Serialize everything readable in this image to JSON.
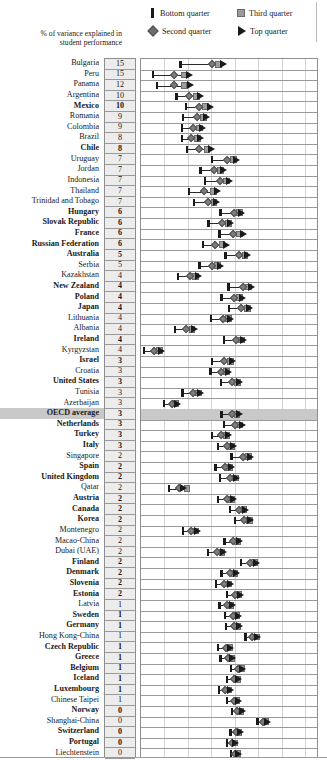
{
  "legend": {
    "items": [
      {
        "label": "Bottom quarter",
        "marker": "bar-icon"
      },
      {
        "label": "Third quarter",
        "marker": "square-icon"
      },
      {
        "label": "Second quarter",
        "marker": "diamond-icon"
      },
      {
        "label": "Top quarter",
        "marker": "triangle-icon"
      }
    ]
  },
  "axis_caption": "% of variance explained in student performance",
  "chart_data": {
    "type": "scatter",
    "title": "",
    "subtitle": "",
    "xlabel": "",
    "ylabel": "",
    "legend_position": "top",
    "grid": true,
    "xlim": [
      300,
      680
    ],
    "x_gridlines": [
      350,
      400,
      450,
      500,
      550,
      600,
      650
    ],
    "value_column_header": "% of variance explained in student performance",
    "series": [
      {
        "name": "Bottom quarter",
        "marker": "bar",
        "color": "#1a1a1a"
      },
      {
        "name": "Second quarter",
        "marker": "diamond",
        "color": "#7d7d7d"
      },
      {
        "name": "Third quarter",
        "marker": "square",
        "color": "#9d9d9d"
      },
      {
        "name": "Top quarter",
        "marker": "triangle",
        "color": "#1a1a1a"
      }
    ],
    "categories": [
      "Bulgaria",
      "Peru",
      "Panama",
      "Argentina",
      "Mexico",
      "Romania",
      "Colombia",
      "Brazil",
      "Chile",
      "Uruguay",
      "Jordan",
      "Indonesia",
      "Thailand",
      "Trinidad and Tobago",
      "Hungary",
      "Slovak Republic",
      "France",
      "Russian Federation",
      "Australia",
      "Serbia",
      "Kazakhstan",
      "New Zealand",
      "Poland",
      "Japan",
      "Lithuania",
      "Albania",
      "Ireland",
      "Kyrgyzstan",
      "Israel",
      "Croatia",
      "United States",
      "Tunisia",
      "Azerbaijan",
      "OECD average",
      "Netherlands",
      "Turkey",
      "Italy",
      "Singapore",
      "Spain",
      "United Kingdom",
      "Qatar",
      "Austria",
      "Canada",
      "Korea",
      "Montenegro",
      "Macao-China",
      "Dubai (UAE)",
      "Finland",
      "Denmark",
      "Slovenia",
      "Estonia",
      "Latvia",
      "Sweden",
      "Germany",
      "Hong Kong-China",
      "Czech Republic",
      "Greece",
      "Belgium",
      "Iceland",
      "Luxembourg",
      "Chinese Taipei",
      "Norway",
      "Shanghai-China",
      "Switzerland",
      "Portugal",
      "Liechtenstein"
    ],
    "rows": [
      {
        "country": "Bulgaria",
        "variance": 15,
        "bold": false,
        "highlight": false,
        "q1": 384,
        "q2": 451,
        "q3": 466,
        "q4": 477
      },
      {
        "country": "Peru",
        "variance": 15,
        "bold": false,
        "highlight": false,
        "q1": 325,
        "q2": 371,
        "q3": 392,
        "q4": 403
      },
      {
        "country": "Panama",
        "variance": 12,
        "bold": false,
        "highlight": false,
        "q1": 334,
        "q2": 371,
        "q3": 392,
        "q4": 405
      },
      {
        "country": "Argentina",
        "variance": 10,
        "bold": false,
        "highlight": false,
        "q1": 376,
        "q2": 402,
        "q3": 418,
        "q4": 428
      },
      {
        "country": "Mexico",
        "variance": 10,
        "bold": true,
        "highlight": false,
        "q1": 396,
        "q2": 423,
        "q3": 438,
        "q4": 449
      },
      {
        "country": "Romania",
        "variance": 9,
        "bold": false,
        "highlight": false,
        "q1": 390,
        "q2": 420,
        "q3": 434,
        "q4": 440
      },
      {
        "country": "Colombia",
        "variance": 9,
        "bold": false,
        "highlight": false,
        "q1": 388,
        "q2": 411,
        "q3": 425,
        "q4": 432
      },
      {
        "country": "Brazil",
        "variance": 8,
        "bold": false,
        "highlight": false,
        "q1": 387,
        "q2": 408,
        "q3": 420,
        "q4": 427
      },
      {
        "country": "Chile",
        "variance": 8,
        "bold": true,
        "highlight": false,
        "q1": 398,
        "q2": 424,
        "q3": 441,
        "q4": 450
      },
      {
        "country": "Uruguay",
        "variance": 7,
        "bold": false,
        "highlight": false,
        "q1": 451,
        "q2": 483,
        "q3": 498,
        "q4": 505
      },
      {
        "country": "Jordan",
        "variance": 7,
        "bold": false,
        "highlight": false,
        "q1": 427,
        "q2": 455,
        "q3": 470,
        "q4": 477
      },
      {
        "country": "Indonesia",
        "variance": 7,
        "bold": false,
        "highlight": false,
        "q1": 436,
        "q2": 468,
        "q3": 483,
        "q4": 490
      },
      {
        "country": "Thailand",
        "variance": 7,
        "bold": false,
        "highlight": false,
        "q1": 403,
        "q2": 434,
        "q3": 454,
        "q4": 463
      },
      {
        "country": "Trinidad and Tobago",
        "variance": 7,
        "bold": false,
        "highlight": false,
        "q1": 413,
        "q2": 443,
        "q3": 456,
        "q4": 462
      },
      {
        "country": "Hungary",
        "variance": 6,
        "bold": true,
        "highlight": false,
        "q1": 470,
        "q2": 498,
        "q3": 510,
        "q4": 515
      },
      {
        "country": "Slovak Republic",
        "variance": 6,
        "bold": true,
        "highlight": false,
        "q1": 444,
        "q2": 473,
        "q3": 487,
        "q4": 492
      },
      {
        "country": "France",
        "variance": 6,
        "bold": true,
        "highlight": false,
        "q1": 468,
        "q2": 497,
        "q3": 511,
        "q4": 518
      },
      {
        "country": "Russian Federation",
        "variance": 6,
        "bold": true,
        "highlight": false,
        "q1": 433,
        "q2": 459,
        "q3": 473,
        "q4": 482
      },
      {
        "country": "Australia",
        "variance": 5,
        "bold": true,
        "highlight": false,
        "q1": 480,
        "q2": 509,
        "q3": 522,
        "q4": 528
      },
      {
        "country": "Serbia",
        "variance": 5,
        "bold": false,
        "highlight": false,
        "q1": 425,
        "q2": 452,
        "q3": 464,
        "q4": 469
      },
      {
        "country": "Kazakhstan",
        "variance": 4,
        "bold": false,
        "highlight": false,
        "q1": 379,
        "q2": 404,
        "q3": 417,
        "q4": 423
      },
      {
        "country": "New Zealand",
        "variance": 4,
        "bold": true,
        "highlight": false,
        "q1": 487,
        "q2": 517,
        "q3": 530,
        "q4": 536
      },
      {
        "country": "Poland",
        "variance": 4,
        "bold": true,
        "highlight": false,
        "q1": 472,
        "q2": 499,
        "q3": 511,
        "q4": 517
      },
      {
        "country": "Japan",
        "variance": 4,
        "bold": true,
        "highlight": false,
        "q1": 488,
        "q2": 514,
        "q3": 527,
        "q4": 532
      },
      {
        "country": "Lithuania",
        "variance": 4,
        "bold": false,
        "highlight": false,
        "q1": 450,
        "q2": 475,
        "q3": 487,
        "q4": 492
      },
      {
        "country": "Albania",
        "variance": 4,
        "bold": false,
        "highlight": false,
        "q1": 372,
        "q2": 396,
        "q3": 409,
        "q4": 414
      },
      {
        "country": "Ireland",
        "variance": 4,
        "bold": true,
        "highlight": false,
        "q1": 477,
        "q2": 503,
        "q3": 515,
        "q4": 520
      },
      {
        "country": "Kyrgyzstan",
        "variance": 4,
        "bold": false,
        "highlight": false,
        "q1": 306,
        "q2": 329,
        "q3": 340,
        "q4": 345
      },
      {
        "country": "Israel",
        "variance": 3,
        "bold": true,
        "highlight": false,
        "q1": 452,
        "q2": 478,
        "q3": 491,
        "q4": 496
      },
      {
        "country": "Croatia",
        "variance": 3,
        "bold": false,
        "highlight": false,
        "q1": 448,
        "q2": 471,
        "q3": 482,
        "q4": 487
      },
      {
        "country": "United States",
        "variance": 3,
        "bold": true,
        "highlight": false,
        "q1": 471,
        "q2": 494,
        "q3": 506,
        "q4": 511
      },
      {
        "country": "Tunisia",
        "variance": 3,
        "bold": false,
        "highlight": false,
        "q1": 389,
        "q2": 412,
        "q3": 423,
        "q4": 428
      },
      {
        "country": "Azerbaijan",
        "variance": 3,
        "bold": false,
        "highlight": false,
        "q1": 349,
        "q2": 366,
        "q3": 374,
        "q4": 379
      },
      {
        "country": "OECD average",
        "variance": 3,
        "bold": true,
        "highlight": true,
        "q1": 472,
        "q2": 494,
        "q3": 505,
        "q4": 510
      },
      {
        "country": "Netherlands",
        "variance": 3,
        "bold": true,
        "highlight": false,
        "q1": 477,
        "q2": 500,
        "q3": 511,
        "q4": 516
      },
      {
        "country": "Turkey",
        "variance": 3,
        "bold": true,
        "highlight": false,
        "q1": 452,
        "q2": 472,
        "q3": 482,
        "q4": 486
      },
      {
        "country": "Italy",
        "variance": 3,
        "bold": true,
        "highlight": false,
        "q1": 464,
        "q2": 484,
        "q3": 494,
        "q4": 498
      },
      {
        "country": "Singapore",
        "variance": 2,
        "bold": false,
        "highlight": false,
        "q1": 493,
        "q2": 518,
        "q3": 529,
        "q4": 534
      },
      {
        "country": "Spain",
        "variance": 2,
        "bold": true,
        "highlight": false,
        "q1": 459,
        "q2": 479,
        "q3": 489,
        "q4": 493
      },
      {
        "country": "United Kingdom",
        "variance": 2,
        "bold": true,
        "highlight": false,
        "q1": 469,
        "q2": 490,
        "q3": 501,
        "q4": 505
      },
      {
        "country": "Qatar",
        "variance": 2,
        "bold": false,
        "highlight": false,
        "q1": 360,
        "q2": 382,
        "q3": 398,
        "q4": 392
      },
      {
        "country": "Austria",
        "variance": 2,
        "bold": true,
        "highlight": false,
        "q1": 464,
        "q2": 484,
        "q3": 494,
        "q4": 498
      },
      {
        "country": "Canada",
        "variance": 2,
        "bold": true,
        "highlight": false,
        "q1": 490,
        "q2": 510,
        "q3": 520,
        "q4": 524
      },
      {
        "country": "Korea",
        "variance": 2,
        "bold": true,
        "highlight": false,
        "q1": 501,
        "q2": 521,
        "q3": 531,
        "q4": 535
      },
      {
        "country": "Montenegro",
        "variance": 2,
        "bold": false,
        "highlight": false,
        "q1": 390,
        "q2": 408,
        "q3": 417,
        "q4": 421
      },
      {
        "country": "Macao-China",
        "variance": 2,
        "bold": false,
        "highlight": false,
        "q1": 478,
        "q2": 497,
        "q3": 506,
        "q4": 510
      },
      {
        "country": "Dubai (UAE)",
        "variance": 2,
        "bold": false,
        "highlight": false,
        "q1": 443,
        "q2": 463,
        "q3": 473,
        "q4": 477
      },
      {
        "country": "Finland",
        "variance": 2,
        "bold": true,
        "highlight": false,
        "q1": 514,
        "q2": 533,
        "q3": 542,
        "q4": 546
      },
      {
        "country": "Denmark",
        "variance": 2,
        "bold": true,
        "highlight": false,
        "q1": 472,
        "q2": 491,
        "q3": 500,
        "q4": 504
      },
      {
        "country": "Slovenia",
        "variance": 2,
        "bold": true,
        "highlight": false,
        "q1": 460,
        "q2": 478,
        "q3": 487,
        "q4": 491
      },
      {
        "country": "Estonia",
        "variance": 2,
        "bold": true,
        "highlight": false,
        "q1": 483,
        "q2": 500,
        "q3": 509,
        "q4": 512
      },
      {
        "country": "Latvia",
        "variance": 1,
        "bold": false,
        "highlight": false,
        "q1": 468,
        "q2": 484,
        "q3": 492,
        "q4": 496
      },
      {
        "country": "Sweden",
        "variance": 1,
        "bold": true,
        "highlight": false,
        "q1": 479,
        "q2": 496,
        "q3": 504,
        "q4": 508
      },
      {
        "country": "Germany",
        "variance": 1,
        "bold": true,
        "highlight": false,
        "q1": 481,
        "q2": 498,
        "q3": 507,
        "q4": 510
      },
      {
        "country": "Hong Kong-China",
        "variance": 1,
        "bold": false,
        "highlight": false,
        "q1": 523,
        "q2": 538,
        "q3": 546,
        "q4": 549
      },
      {
        "country": "Czech Republic",
        "variance": 1,
        "bold": true,
        "highlight": false,
        "q1": 465,
        "q2": 481,
        "q3": 489,
        "q4": 492
      },
      {
        "country": "Greece",
        "variance": 1,
        "bold": true,
        "highlight": false,
        "q1": 470,
        "q2": 485,
        "q3": 493,
        "q4": 496
      },
      {
        "country": "Belgium",
        "variance": 1,
        "bold": true,
        "highlight": false,
        "q1": 492,
        "q2": 507,
        "q3": 514,
        "q4": 517
      },
      {
        "country": "Iceland",
        "variance": 1,
        "bold": true,
        "highlight": false,
        "q1": 484,
        "q2": 499,
        "q3": 506,
        "q4": 509
      },
      {
        "country": "Luxembourg",
        "variance": 1,
        "bold": true,
        "highlight": false,
        "q1": 466,
        "q2": 480,
        "q3": 488,
        "q4": 491
      },
      {
        "country": "Chinese Taipei",
        "variance": 1,
        "bold": false,
        "highlight": false,
        "q1": 484,
        "q2": 498,
        "q3": 505,
        "q4": 508
      },
      {
        "country": "Norway",
        "variance": 0,
        "bold": true,
        "highlight": false,
        "q1": 494,
        "q2": 506,
        "q3": 513,
        "q4": 516
      },
      {
        "country": "Shanghai-China",
        "variance": 0,
        "bold": false,
        "highlight": false,
        "q1": 549,
        "q2": 560,
        "q3": 567,
        "q4": 570
      },
      {
        "country": "Switzerland",
        "variance": 0,
        "bold": true,
        "highlight": false,
        "q1": 491,
        "q2": 502,
        "q3": 509,
        "q4": 512
      },
      {
        "country": "Portugal",
        "variance": 0,
        "bold": true,
        "highlight": false,
        "q1": 483,
        "q2": 494,
        "q3": 500,
        "q4": 503
      },
      {
        "country": "Liechtenstein",
        "variance": 0,
        "bold": false,
        "highlight": false,
        "q1": 492,
        "q2": 500,
        "q3": 506,
        "q4": 509
      }
    ]
  }
}
